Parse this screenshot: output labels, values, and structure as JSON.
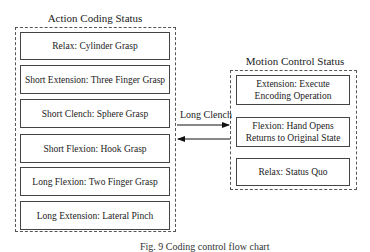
{
  "left_panel": {
    "title": "Action Coding Status",
    "items": [
      {
        "label": "Relax: Cylinder Grasp"
      },
      {
        "label": "Short Extension: Three Finger Grasp"
      },
      {
        "label": "Short Clench: Sphere Grasp"
      },
      {
        "label": "Short Flexion: Hook Grasp"
      },
      {
        "label": "Long Flexion: Two Finger Grasp"
      },
      {
        "label": "Long Extension: Lateral Pinch"
      }
    ]
  },
  "right_panel": {
    "title": "Motion Control Status",
    "items": [
      {
        "label": "Extension: Execute Encoding Operation"
      },
      {
        "label": "Flexion: Hand Opens Returns to Original State"
      },
      {
        "label": "Relax: Status Quo"
      }
    ]
  },
  "connector": {
    "label": "Long Clench"
  },
  "caption": "Fig. 9  Coding control flow chart"
}
